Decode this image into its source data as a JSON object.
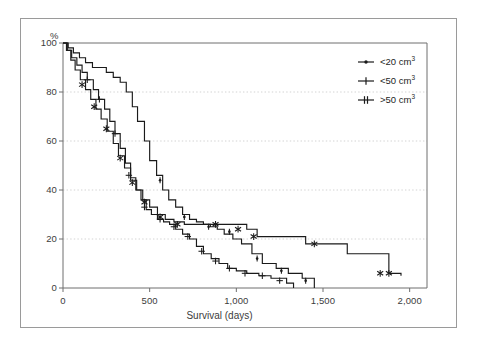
{
  "chart_data": {
    "type": "line",
    "title": "",
    "subtitle": "",
    "xlabel": "Survival (days)",
    "ylabel": "%",
    "ylabel_unit": "%",
    "xlim": [
      0,
      2100
    ],
    "ylim": [
      0,
      100
    ],
    "x_ticks": [
      0,
      500,
      1000,
      1500,
      2000
    ],
    "x_tick_labels": [
      "0",
      "500",
      "1,000",
      "1,500",
      "2,000"
    ],
    "y_ticks": [
      0,
      20,
      40,
      60,
      80,
      100
    ],
    "y_tick_labels": [
      "0",
      "20",
      "40",
      "60",
      "80",
      "100"
    ],
    "grid": "horizontal-dotted",
    "grid_color": "#c8c8c8",
    "legend_position": "top-right",
    "step_style": "post",
    "series": [
      {
        "name": "<20 cm3",
        "label_prefix": "<20 cm",
        "label_sup": "3",
        "marker": "dot-dash",
        "color": "#1a1a1a",
        "x": [
          0,
          30,
          60,
          95,
          130,
          170,
          210,
          250,
          290,
          330,
          365,
          400,
          430,
          470,
          500,
          540,
          575,
          610,
          650,
          690,
          730,
          770,
          810,
          850,
          890,
          930,
          980,
          1030,
          1090,
          1150,
          1230,
          1300,
          1380,
          1450
        ],
        "y": [
          100,
          98,
          96,
          94,
          92,
          90,
          90,
          88,
          86,
          84,
          80,
          74,
          68,
          60,
          52,
          46,
          40,
          36,
          33,
          30,
          28,
          27,
          26,
          25,
          24,
          22,
          20,
          18,
          14,
          10,
          8,
          6,
          4,
          0
        ],
        "censor_x": [
          560,
          700,
          840,
          960,
          1120,
          1260,
          1400
        ],
        "censor_y": [
          44,
          29,
          25,
          23,
          12,
          7,
          3
        ]
      },
      {
        "name": "<50 cm3",
        "label_prefix": "<50 cm",
        "label_sup": "3",
        "marker": "plus",
        "color": "#1a1a1a",
        "x": [
          0,
          25,
          50,
          80,
          110,
          140,
          175,
          205,
          240,
          270,
          300,
          330,
          360,
          390,
          420,
          450,
          480,
          510,
          545,
          580,
          615,
          650,
          690,
          730,
          770,
          810,
          855,
          900,
          950,
          1000,
          1060,
          1130,
          1200,
          1290,
          1330
        ],
        "y": [
          100,
          97,
          94,
          91,
          88,
          85,
          81,
          77,
          73,
          68,
          63,
          57,
          51,
          45,
          40,
          36,
          32,
          30,
          28,
          27,
          26,
          24,
          22,
          20,
          17,
          14,
          12,
          10,
          8,
          7,
          6,
          5,
          4,
          2,
          0
        ],
        "censor_x": [
          140,
          210,
          300,
          380,
          470,
          560,
          640,
          720,
          800,
          880,
          960,
          1050,
          1150,
          1250
        ],
        "censor_y": [
          85,
          77,
          63,
          46,
          33,
          28,
          25,
          21,
          15,
          11,
          8,
          6,
          5,
          3
        ]
      },
      {
        "name": ">50 cm3",
        "label_prefix": ">50 cm",
        "label_sup": "3",
        "marker": "asterisk",
        "color": "#1a1a1a",
        "x": [
          0,
          20,
          45,
          70,
          100,
          130,
          160,
          190,
          220,
          255,
          290,
          320,
          355,
          390,
          425,
          460,
          500,
          545,
          590,
          640,
          700,
          760,
          830,
          900,
          980,
          1060,
          1120,
          1200,
          1300,
          1400,
          1520,
          1640,
          1760,
          1880,
          1950
        ],
        "y": [
          100,
          97,
          93,
          89,
          85,
          81,
          77,
          73,
          69,
          64,
          59,
          54,
          49,
          44,
          40,
          36,
          33,
          30,
          28,
          27,
          26,
          26,
          26,
          26,
          26,
          24,
          21,
          21,
          21,
          18,
          18,
          14,
          14,
          6,
          5
        ],
        "censor_x": [
          110,
          180,
          250,
          330,
          400,
          470,
          560,
          660,
          880,
          1010,
          1100,
          1450,
          1830,
          1880
        ],
        "censor_y": [
          83,
          74,
          65,
          53,
          43,
          35,
          29,
          26,
          26,
          24,
          21,
          18,
          6,
          6
        ]
      }
    ]
  },
  "axis": {
    "y_unit_label": "%",
    "x_title": "Survival (days)"
  },
  "legend": {
    "items": [
      {
        "label_prefix": "<20 cm",
        "label_sup": "3",
        "marker": "dot-dash"
      },
      {
        "label_prefix": "<50 cm",
        "label_sup": "3",
        "marker": "plus"
      },
      {
        "label_prefix": ">50 cm",
        "label_sup": "3",
        "marker": "asterisk"
      }
    ]
  }
}
